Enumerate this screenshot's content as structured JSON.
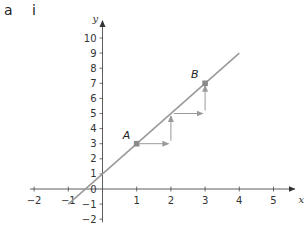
{
  "header": {
    "part": "a",
    "subpart": "i"
  },
  "chart_data": {
    "type": "line",
    "title": "",
    "xlabel": "x",
    "ylabel": "y",
    "xlim": [
      -2,
      5.5
    ],
    "ylim": [
      -2,
      11
    ],
    "x_ticks": [
      -2,
      -1,
      1,
      2,
      3,
      4,
      5
    ],
    "y_ticks": [
      -2,
      -1,
      1,
      2,
      3,
      4,
      5,
      6,
      7,
      8,
      9,
      10
    ],
    "origin_label": "0",
    "grid": false,
    "series": [
      {
        "name": "y = 2x + 1",
        "x": [
          -1,
          4
        ],
        "y": [
          -1,
          9
        ],
        "color": "#9a9a9a"
      }
    ],
    "points": [
      {
        "name": "A",
        "x": 1,
        "y": 3
      },
      {
        "name": "B",
        "x": 3,
        "y": 7
      }
    ],
    "step_arrows": [
      {
        "from": [
          1,
          3
        ],
        "to": [
          2,
          3
        ]
      },
      {
        "from": [
          2,
          3
        ],
        "to": [
          2,
          5
        ]
      },
      {
        "from": [
          2,
          5
        ],
        "to": [
          3,
          5
        ]
      },
      {
        "from": [
          3,
          5
        ],
        "to": [
          3,
          7
        ]
      }
    ]
  }
}
